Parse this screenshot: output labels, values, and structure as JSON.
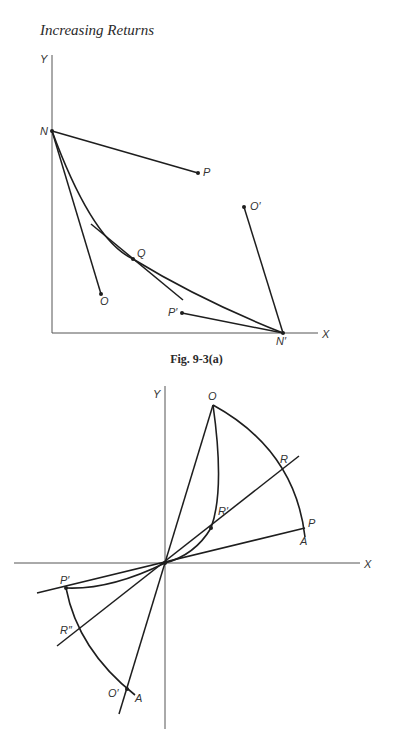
{
  "header": {
    "title": "Increasing Returns"
  },
  "figure_a": {
    "caption": "Fig. 9-3(a)",
    "axis_labels": {
      "y": "Y",
      "x": "X"
    },
    "points": {
      "N": "N",
      "P": "P",
      "O_prime": "O′",
      "Q": "Q",
      "O": "O",
      "P_prime": "P′",
      "N_prime": "N′"
    }
  },
  "figure_b": {
    "axis_labels": {
      "y": "Y",
      "x": "X"
    },
    "points": {
      "O": "O",
      "R": "R",
      "R_prime": "R′",
      "P": "P",
      "A_upper": "A",
      "P_prime": "P′",
      "R_double_prime": "R″",
      "O_prime": "O′",
      "A_lower": "A"
    }
  }
}
